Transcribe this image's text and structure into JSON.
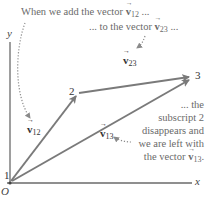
{
  "diagram": {
    "colors": {
      "vector": "#7a7a7a",
      "axis": "#6a6a6a",
      "dotted": "#8a8a8a",
      "text": "#555555"
    },
    "axes": {
      "x_label": "x",
      "y_label": "y",
      "origin_label": "O"
    },
    "points": [
      {
        "label": "1",
        "x": 10,
        "y": 180
      },
      {
        "label": "2",
        "x": 78,
        "y": 93
      },
      {
        "label": "3",
        "x": 193,
        "y": 77
      }
    ],
    "vectors": [
      {
        "name": "v12",
        "symbol": "v",
        "subscript": "12",
        "from": "1",
        "to": "2"
      },
      {
        "name": "v23",
        "symbol": "v",
        "subscript": "23",
        "from": "2",
        "to": "3"
      },
      {
        "name": "v13",
        "symbol": "v",
        "subscript": "13",
        "from": "1",
        "to": "3"
      }
    ],
    "annotations": {
      "top_line_1_prefix": "When we add the vector ",
      "top_line_1_sym": "v",
      "top_line_1_sub": "12",
      "top_line_1_suffix": " ...",
      "top_line_2_prefix": "... to the vector ",
      "top_line_2_sym": "v",
      "top_line_2_sub": "23",
      "top_line_2_suffix": " ...",
      "right_lines": [
        "... the",
        "subscript 2",
        "disappears and",
        "we are left with"
      ],
      "right_last_prefix": "the vector ",
      "right_last_sym": "v",
      "right_last_sub": "13",
      "right_last_suffix": "."
    }
  }
}
